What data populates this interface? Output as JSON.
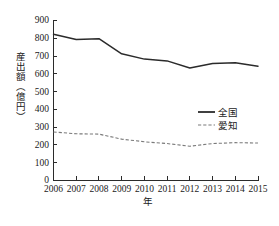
{
  "chart_data": {
    "type": "line",
    "title": "",
    "xlabel": "年",
    "ylabel": "産出額（億円）",
    "categories": [
      "2006",
      "2007",
      "2008",
      "2009",
      "2010",
      "2011",
      "2012",
      "2013",
      "2014",
      "2015"
    ],
    "x": [
      2006,
      2007,
      2008,
      2009,
      2010,
      2011,
      2012,
      2013,
      2014,
      2015
    ],
    "ylim": [
      0,
      900
    ],
    "yticks": [
      0,
      100,
      200,
      300,
      400,
      500,
      600,
      700,
      800,
      900
    ],
    "ytick_labels": [
      "0",
      "100",
      "200",
      "300",
      "400",
      "500",
      "600",
      "700",
      "800",
      "900"
    ],
    "xlim": [
      2006,
      2015
    ],
    "grid": false,
    "legend_position": "right-middle",
    "series": [
      {
        "name": "全国",
        "style": "solid",
        "color": "#2b2b2b",
        "values": [
          820,
          790,
          795,
          710,
          680,
          670,
          630,
          655,
          660,
          640
        ]
      },
      {
        "name": "愛知",
        "style": "dashed",
        "color": "#7a7a7a",
        "values": [
          270,
          260,
          258,
          230,
          215,
          205,
          190,
          205,
          210,
          208
        ]
      }
    ]
  },
  "legend": {
    "items": [
      {
        "label": "全国",
        "style": "solid",
        "color": "#2b2b2b"
      },
      {
        "label": "愛知",
        "style": "dashed",
        "color": "#7a7a7a"
      }
    ]
  },
  "axes": {
    "y_axis_title": "産出額（億円）",
    "x_axis_title": "年"
  }
}
